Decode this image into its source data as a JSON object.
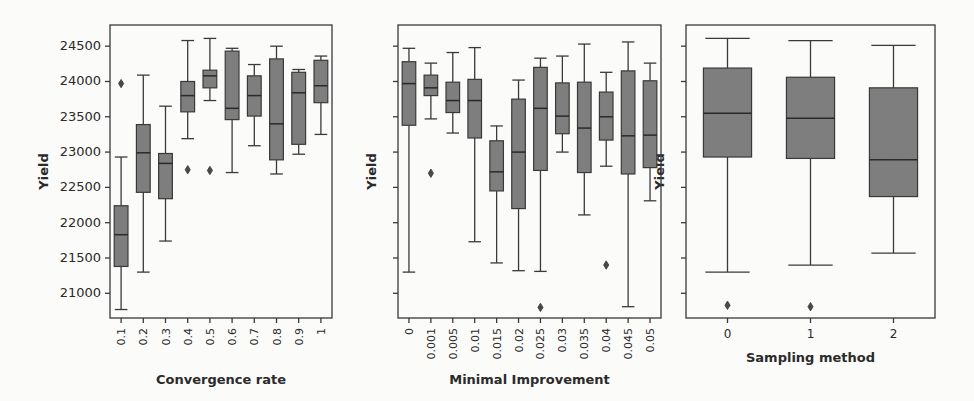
{
  "figure": {
    "kind": "boxplot-grid",
    "panel_count": 3,
    "background_color": "#fdfdfb",
    "box_fill_color": "#7f7f7f",
    "box_edge_color": "#3a3a3a",
    "text_color": "#2b2b2b"
  },
  "chart_data": [
    {
      "type": "box",
      "panel_index": 0,
      "title": "",
      "xlabel": "Convergence rate",
      "ylabel": "Yield",
      "ylim": [
        20650,
        24800
      ],
      "yticks": [
        21000,
        21500,
        22000,
        22500,
        23000,
        23500,
        24000,
        24500
      ],
      "ytick_labels": [
        "21000",
        "21500",
        "22000",
        "22500",
        "23000",
        "23500",
        "24000",
        "24500"
      ],
      "grid": false,
      "legend": "none",
      "categories": [
        "0.1",
        "0.2",
        "0.3",
        "0.4",
        "0.5",
        "0.6",
        "0.7",
        "0.8",
        "0.9",
        "1"
      ],
      "boxes": [
        {
          "category": "0.1",
          "whisker_low": 20770,
          "q1": 21380,
          "median": 21830,
          "q3": 22240,
          "whisker_high": 22930,
          "outliers": [
            23970
          ]
        },
        {
          "category": "0.2",
          "whisker_low": 21300,
          "q1": 22430,
          "median": 22990,
          "q3": 23390,
          "whisker_high": 24090,
          "outliers": []
        },
        {
          "category": "0.3",
          "whisker_low": 21740,
          "q1": 22340,
          "median": 22840,
          "q3": 22980,
          "whisker_high": 23650,
          "outliers": []
        },
        {
          "category": "0.4",
          "whisker_low": 23190,
          "q1": 23570,
          "median": 23800,
          "q3": 24000,
          "whisker_high": 24580,
          "outliers": [
            22750
          ]
        },
        {
          "category": "0.5",
          "whisker_low": 23730,
          "q1": 23910,
          "median": 24080,
          "q3": 24160,
          "whisker_high": 24610,
          "outliers": [
            22740
          ]
        },
        {
          "category": "0.6",
          "whisker_low": 22710,
          "q1": 23460,
          "median": 23620,
          "q3": 24430,
          "whisker_high": 24470,
          "outliers": []
        },
        {
          "category": "0.7",
          "whisker_low": 23090,
          "q1": 23510,
          "median": 23800,
          "q3": 24080,
          "whisker_high": 24240,
          "outliers": []
        },
        {
          "category": "0.8",
          "whisker_low": 22690,
          "q1": 22890,
          "median": 23400,
          "q3": 24320,
          "whisker_high": 24500,
          "outliers": []
        },
        {
          "category": "0.9",
          "whisker_low": 22970,
          "q1": 23110,
          "median": 23840,
          "q3": 24130,
          "whisker_high": 24170,
          "outliers": []
        },
        {
          "category": "1",
          "whisker_low": 23250,
          "q1": 23700,
          "median": 23940,
          "q3": 24300,
          "whisker_high": 24360,
          "outliers": []
        }
      ]
    },
    {
      "type": "box",
      "panel_index": 1,
      "title": "",
      "xlabel": "Minimal Improvement",
      "ylabel": "Yield",
      "ylim": [
        20650,
        24800
      ],
      "yticks": [
        21000,
        21500,
        22000,
        22500,
        23000,
        23500,
        24000,
        24500
      ],
      "ytick_labels": [
        "",
        "",
        "",
        "",
        "",
        "",
        "",
        ""
      ],
      "grid": false,
      "legend": "none",
      "categories": [
        "0",
        "0.001",
        "0.005",
        "0.01",
        "0.015",
        "0.02",
        "0.025",
        "0.03",
        "0.035",
        "0.04",
        "0.045",
        "0.05"
      ],
      "boxes": [
        {
          "category": "0",
          "whisker_low": 21300,
          "q1": 23380,
          "median": 23970,
          "q3": 24280,
          "whisker_high": 24470,
          "outliers": []
        },
        {
          "category": "0.001",
          "whisker_low": 23470,
          "q1": 23800,
          "median": 23910,
          "q3": 24090,
          "whisker_high": 24260,
          "outliers": [
            22700
          ]
        },
        {
          "category": "0.005",
          "whisker_low": 23270,
          "q1": 23560,
          "median": 23730,
          "q3": 23990,
          "whisker_high": 24410,
          "outliers": []
        },
        {
          "category": "0.01",
          "whisker_low": 21730,
          "q1": 23200,
          "median": 23730,
          "q3": 24030,
          "whisker_high": 24480,
          "outliers": []
        },
        {
          "category": "0.015",
          "whisker_low": 21430,
          "q1": 22450,
          "median": 22720,
          "q3": 23160,
          "whisker_high": 23370,
          "outliers": []
        },
        {
          "category": "0.02",
          "whisker_low": 21320,
          "q1": 22200,
          "median": 23000,
          "q3": 23750,
          "whisker_high": 24020,
          "outliers": []
        },
        {
          "category": "0.025",
          "whisker_low": 21310,
          "q1": 22740,
          "median": 23620,
          "q3": 24200,
          "whisker_high": 24330,
          "outliers": [
            20800
          ]
        },
        {
          "category": "0.03",
          "whisker_low": 23000,
          "q1": 23260,
          "median": 23510,
          "q3": 23980,
          "whisker_high": 24360,
          "outliers": []
        },
        {
          "category": "0.035",
          "whisker_low": 22110,
          "q1": 22710,
          "median": 23340,
          "q3": 23990,
          "whisker_high": 24530,
          "outliers": []
        },
        {
          "category": "0.04",
          "whisker_low": 22800,
          "q1": 23170,
          "median": 23500,
          "q3": 23850,
          "whisker_high": 24130,
          "outliers": [
            21400
          ]
        },
        {
          "category": "0.045",
          "whisker_low": 20810,
          "q1": 22690,
          "median": 23230,
          "q3": 24150,
          "whisker_high": 24560,
          "outliers": []
        },
        {
          "category": "0.05",
          "whisker_low": 22310,
          "q1": 22780,
          "median": 23240,
          "q3": 24010,
          "whisker_high": 24260,
          "outliers": []
        }
      ]
    },
    {
      "type": "box",
      "panel_index": 2,
      "title": "",
      "xlabel": "Sampling method",
      "ylabel": "Yield",
      "ylim": [
        20650,
        24800
      ],
      "yticks": [
        21000,
        21500,
        22000,
        22500,
        23000,
        23500,
        24000,
        24500
      ],
      "ytick_labels": [
        "",
        "",
        "",
        "",
        "",
        "",
        "",
        ""
      ],
      "grid": false,
      "legend": "none",
      "categories": [
        "0",
        "1",
        "2"
      ],
      "boxes": [
        {
          "category": "0",
          "whisker_low": 21300,
          "q1": 22930,
          "median": 23550,
          "q3": 24190,
          "whisker_high": 24610,
          "outliers": [
            20830
          ]
        },
        {
          "category": "1",
          "whisker_low": 21400,
          "q1": 22910,
          "median": 23480,
          "q3": 24060,
          "whisker_high": 24580,
          "outliers": [
            20810
          ]
        },
        {
          "category": "2",
          "whisker_low": 21570,
          "q1": 22370,
          "median": 22890,
          "q3": 23910,
          "whisker_high": 24510,
          "outliers": []
        }
      ]
    }
  ]
}
